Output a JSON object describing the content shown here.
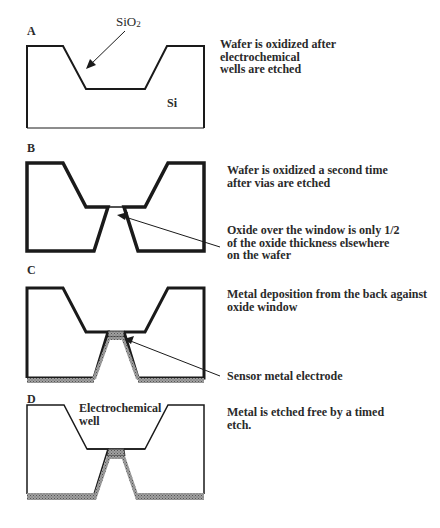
{
  "panels": [
    {
      "letter": "A",
      "description": [
        "Wafer is oxidized after",
        "electrochemical",
        "wells are etched"
      ],
      "labels": {
        "oxide": "SiO",
        "oxide_sub": "2",
        "substrate": "Si"
      }
    },
    {
      "letter": "B",
      "description": [
        "Wafer is oxidized a second time",
        "after vias are etched"
      ],
      "callout": [
        "Oxide over the window is only 1/2",
        "of the oxide thickness elsewhere",
        "on the wafer"
      ]
    },
    {
      "letter": "C",
      "description": [
        "Metal deposition from the back against",
        "oxide window"
      ],
      "callout": [
        "Sensor metal electrode"
      ]
    },
    {
      "letter": "D",
      "description": [
        "Metal is etched free by a timed",
        "etch."
      ],
      "labels": {
        "well": [
          "Electrochemical",
          "well"
        ]
      }
    }
  ],
  "colors": {
    "line": "#1a1a1a",
    "metal": "#8c8c8c",
    "background": "#ffffff"
  }
}
